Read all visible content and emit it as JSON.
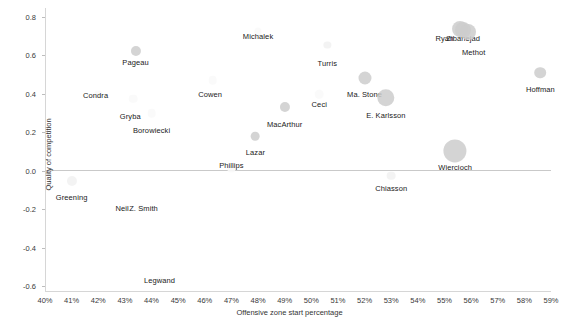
{
  "chart_data": {
    "type": "scatter",
    "title": "",
    "xlabel": "Offensive zone start percentage",
    "ylabel": "Quality of competition",
    "xlim": [
      40,
      59
    ],
    "ylim": [
      -0.6,
      0.8
    ],
    "grid": false,
    "legend": "none",
    "x_tick_labels": [
      "40%",
      "41%",
      "42%",
      "43%",
      "44%",
      "45%",
      "46%",
      "47%",
      "48%",
      "49%",
      "50%",
      "51%",
      "52%",
      "53%",
      "54%",
      "55%",
      "56%",
      "57%",
      "58%",
      "59%"
    ],
    "x_tick_values": [
      40,
      41,
      42,
      43,
      44,
      45,
      46,
      47,
      48,
      49,
      50,
      51,
      52,
      53,
      54,
      55,
      56,
      57,
      58,
      59
    ],
    "y_tick_labels": [
      "0.8",
      "0.6",
      "0.4",
      "0.2",
      "0.0",
      "-0.2",
      "-0.4",
      "-0.6"
    ],
    "y_tick_values": [
      0.8,
      0.6,
      0.4,
      0.2,
      0.0,
      -0.2,
      -0.4,
      -0.6
    ],
    "zero_reference_line": 0.0,
    "size_encoding": "bubble area = ice time",
    "points": [
      {
        "label": "Pageau",
        "x": 43.4,
        "y": 0.625,
        "size": 7,
        "shade": "mid",
        "lx": 43.4,
        "ly": 0.565
      },
      {
        "label": "Michalek",
        "x": 48.0,
        "y": 0.725,
        "size": 5,
        "shade": "vfaint",
        "lx": 48.0,
        "ly": 0.7
      },
      {
        "label": "Turris",
        "x": 50.6,
        "y": 0.655,
        "size": 5,
        "shade": "faint",
        "lx": 50.6,
        "ly": 0.56
      },
      {
        "label": "Ryan",
        "x": 55.6,
        "y": 0.735,
        "size": 11,
        "shade": "mid",
        "lx": 55.0,
        "ly": 0.69
      },
      {
        "label": "Zibanejad",
        "x": 55.7,
        "y": 0.73,
        "size": 11,
        "shade": "mid",
        "lx": 55.7,
        "ly": 0.692
      },
      {
        "label": "Methot",
        "x": 55.9,
        "y": 0.72,
        "size": 11,
        "shade": "mid",
        "lx": 56.1,
        "ly": 0.62
      },
      {
        "label": "Hoffman",
        "x": 58.6,
        "y": 0.51,
        "size": 8,
        "shade": "mid",
        "lx": 58.6,
        "ly": 0.425
      },
      {
        "label": "Ma. Stone",
        "x": 52.0,
        "y": 0.485,
        "size": 9,
        "shade": "mid",
        "lx": 52.0,
        "ly": 0.4
      },
      {
        "label": "E. Karlsson",
        "x": 52.8,
        "y": 0.38,
        "size": 12,
        "shade": "mid",
        "lx": 52.8,
        "ly": 0.29
      },
      {
        "label": "Cowen",
        "x": 46.3,
        "y": 0.47,
        "size": 6,
        "shade": "vfaint",
        "lx": 46.2,
        "ly": 0.4
      },
      {
        "label": "Condra",
        "x": 42.0,
        "y": 0.4,
        "size": 5,
        "shade": "vfaint",
        "lx": 41.9,
        "ly": 0.395
      },
      {
        "label": "Gryba",
        "x": 43.3,
        "y": 0.375,
        "size": 6,
        "shade": "vfaint",
        "lx": 43.2,
        "ly": 0.285
      },
      {
        "label": "Borowiecki",
        "x": 44.0,
        "y": 0.3,
        "size": 6,
        "shade": "vfaint",
        "lx": 44.0,
        "ly": 0.21
      },
      {
        "label": "Ceci",
        "x": 50.3,
        "y": 0.4,
        "size": 6,
        "shade": "vfaint",
        "lx": 50.3,
        "ly": 0.345
      },
      {
        "label": "MacArthur",
        "x": 49.0,
        "y": 0.33,
        "size": 7,
        "shade": "mid",
        "lx": 49.0,
        "ly": 0.245
      },
      {
        "label": "Lazar",
        "x": 47.9,
        "y": 0.18,
        "size": 6,
        "shade": "mid",
        "lx": 47.9,
        "ly": 0.095
      },
      {
        "label": "Wiercioch",
        "x": 55.4,
        "y": 0.105,
        "size": 16,
        "shade": "mid",
        "lx": 55.4,
        "ly": 0.02
      },
      {
        "label": "Phillips",
        "x": 47.0,
        "y": 0.01,
        "size": 5,
        "shade": "vfaint",
        "lx": 47.0,
        "ly": 0.032
      },
      {
        "label": "Chiasson",
        "x": 53.0,
        "y": -0.025,
        "size": 6,
        "shade": "faint",
        "lx": 53.0,
        "ly": -0.09
      },
      {
        "label": "Greening",
        "x": 41.0,
        "y": -0.055,
        "size": 7,
        "shade": "faint",
        "lx": 41.0,
        "ly": -0.135
      },
      {
        "label": "Neil",
        "x": 43.0,
        "y": -0.195,
        "size": 5,
        "shade": "vfaint",
        "lx": 42.9,
        "ly": -0.195
      },
      {
        "label": "Z. Smith",
        "x": 43.6,
        "y": -0.195,
        "size": 5,
        "shade": "vfaint",
        "lx": 43.7,
        "ly": -0.195
      },
      {
        "label": "Legwand",
        "x": 44.3,
        "y": -0.57,
        "size": 5,
        "shade": "vfaint",
        "lx": 44.3,
        "ly": -0.57
      }
    ]
  }
}
